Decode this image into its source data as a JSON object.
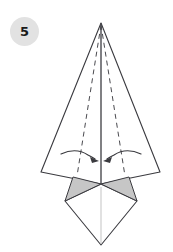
{
  "figure": {
    "step_badge": {
      "label": "5",
      "background_color": "#e2e2e2",
      "text_color": "#1a1a1a",
      "center_x": 24,
      "center_y": 31,
      "radius": 14
    },
    "canvas": {
      "width": 173,
      "height": 252,
      "background_color": "#ffffff"
    },
    "colors": {
      "outline": "#3a3a3f",
      "shaded_fill": "#c6c6c6",
      "paper_fill": "#ffffff",
      "crease_dashed": "#4a4a4f",
      "center_line": "#4a4a4f",
      "faint_line": "#c9c9c9",
      "arrow": "#3a3a3f"
    },
    "shapes": [
      {
        "name": "main-kite-body",
        "type": "polygon",
        "fill": "#ffffff",
        "stroke": "#3a3a3f",
        "points": "101,23 160,172 101,184 41,172"
      },
      {
        "name": "left-shaded-triangle",
        "type": "polygon",
        "fill": "#c6c6c6",
        "stroke": "#3a3a3f",
        "points": "101,184 73,177 65,201"
      },
      {
        "name": "right-shaded-triangle",
        "type": "polygon",
        "fill": "#c6c6c6",
        "stroke": "#3a3a3f",
        "points": "101,184 129,177 137,201"
      },
      {
        "name": "bottom-diamond-flap",
        "type": "polygon",
        "fill": "#ffffff",
        "stroke": "#3a3a3f",
        "points": "101,184 137,201 101,245 65,201"
      }
    ],
    "creases": [
      {
        "name": "left-dashed-crease",
        "style": "dashed",
        "from_x": 101,
        "from_y": 25,
        "to_x": 77,
        "to_y": 176
      },
      {
        "name": "right-dashed-crease",
        "style": "dashed",
        "from_x": 101,
        "from_y": 25,
        "to_x": 125,
        "to_y": 176
      },
      {
        "name": "center-vertical-line",
        "style": "solid",
        "from_x": 101,
        "from_y": 23,
        "to_x": 101,
        "to_y": 184
      },
      {
        "name": "lower-center-faint-line",
        "style": "solid-faint",
        "from_x": 101,
        "from_y": 186,
        "to_x": 101,
        "to_y": 243
      }
    ],
    "arrows": [
      {
        "name": "left-fold-arrow",
        "direction": "right",
        "description": "curved arrow indicating left flap folds toward center",
        "path": "M 62,155 Q 75,148 86,155 Q 92,158 95,160",
        "head_x": 97,
        "head_y": 161
      },
      {
        "name": "right-fold-arrow",
        "direction": "left",
        "description": "curved arrow indicating right flap folds toward center",
        "path": "M 140,155 Q 127,148 116,155 Q 110,158 107,160",
        "head_x": 105,
        "head_y": 161
      }
    ]
  }
}
